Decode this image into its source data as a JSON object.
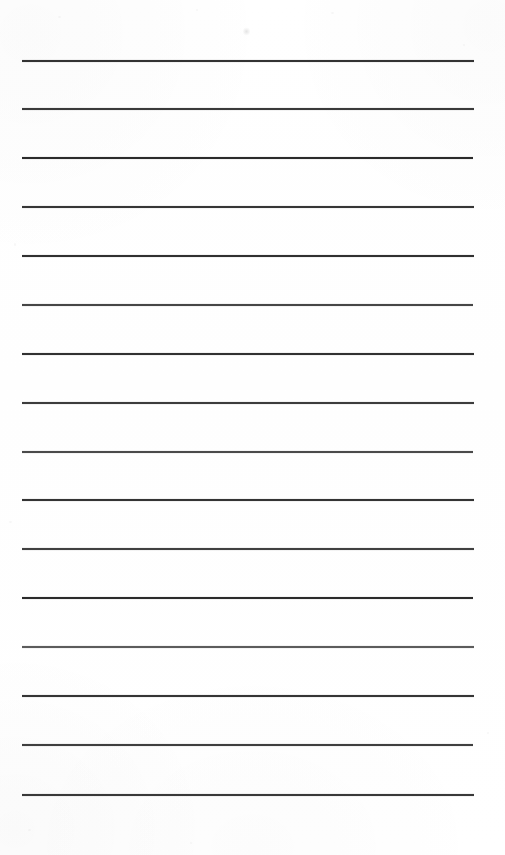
{
  "document": {
    "kind": "scanned-ruled-notepad-page",
    "page_width": 505,
    "page_height": 855,
    "background_color": "#ffffff",
    "text_content": "",
    "visible_text": []
  },
  "ruled_lines": {
    "count": 16,
    "left_x": 22,
    "right_x": 474,
    "first_line_y": 61,
    "spacing": 48.9,
    "default_color": "#2b2b2b",
    "items": [
      {
        "index": 1,
        "y": 61,
        "x1": 22,
        "x2": 474,
        "thickness": 1.6,
        "color": "#2e2e2e",
        "opacity": 0.96
      },
      {
        "index": 2,
        "y": 109,
        "x1": 22,
        "x2": 474,
        "thickness": 1.5,
        "color": "#313131",
        "opacity": 0.94
      },
      {
        "index": 3,
        "y": 158,
        "x1": 22,
        "x2": 473,
        "thickness": 1.7,
        "color": "#272727",
        "opacity": 0.97
      },
      {
        "index": 4,
        "y": 207,
        "x1": 22,
        "x2": 474,
        "thickness": 1.5,
        "color": "#2f2f2f",
        "opacity": 0.95
      },
      {
        "index": 5,
        "y": 256,
        "x1": 22,
        "x2": 474,
        "thickness": 1.6,
        "color": "#2b2b2b",
        "opacity": 0.96
      },
      {
        "index": 6,
        "y": 305,
        "x1": 22,
        "x2": 473,
        "thickness": 1.4,
        "color": "#3a3a3a",
        "opacity": 0.92
      },
      {
        "index": 7,
        "y": 354,
        "x1": 22,
        "x2": 474,
        "thickness": 1.6,
        "color": "#2c2c2c",
        "opacity": 0.96
      },
      {
        "index": 8,
        "y": 403,
        "x1": 22,
        "x2": 474,
        "thickness": 1.5,
        "color": "#333333",
        "opacity": 0.94
      },
      {
        "index": 9,
        "y": 452,
        "x1": 22,
        "x2": 473,
        "thickness": 1.4,
        "color": "#3d3d3d",
        "opacity": 0.91
      },
      {
        "index": 10,
        "y": 500,
        "x1": 22,
        "x2": 474,
        "thickness": 1.6,
        "color": "#2d2d2d",
        "opacity": 0.95
      },
      {
        "index": 11,
        "y": 549,
        "x1": 22,
        "x2": 474,
        "thickness": 1.5,
        "color": "#353535",
        "opacity": 0.93
      },
      {
        "index": 12,
        "y": 598,
        "x1": 22,
        "x2": 473,
        "thickness": 1.7,
        "color": "#282828",
        "opacity": 0.97
      },
      {
        "index": 13,
        "y": 647,
        "x1": 22,
        "x2": 474,
        "thickness": 1.4,
        "color": "#4a4a4a",
        "opacity": 0.88
      },
      {
        "index": 14,
        "y": 696,
        "x1": 22,
        "x2": 474,
        "thickness": 1.6,
        "color": "#2e2e2e",
        "opacity": 0.95
      },
      {
        "index": 15,
        "y": 745,
        "x1": 22,
        "x2": 473,
        "thickness": 1.5,
        "color": "#343434",
        "opacity": 0.93
      },
      {
        "index": 16,
        "y": 795,
        "x1": 22,
        "x2": 474,
        "thickness": 1.5,
        "color": "#303030",
        "opacity": 0.94
      }
    ]
  },
  "artifacts": {
    "speck": {
      "x": 243,
      "y": 27,
      "label": "scan-speck"
    },
    "dust": [
      {
        "x": 58,
        "y": 16,
        "w": 3,
        "h": 2
      },
      {
        "x": 196,
        "y": 9,
        "w": 2,
        "h": 2
      },
      {
        "x": 331,
        "y": 12,
        "w": 3,
        "h": 2
      },
      {
        "x": 463,
        "y": 44,
        "w": 2,
        "h": 2
      },
      {
        "x": 14,
        "y": 243,
        "w": 2,
        "h": 3
      },
      {
        "x": 9,
        "y": 521,
        "w": 3,
        "h": 2
      },
      {
        "x": 28,
        "y": 829,
        "w": 3,
        "h": 2
      },
      {
        "x": 190,
        "y": 842,
        "w": 2,
        "h": 2
      },
      {
        "x": 487,
        "y": 732,
        "w": 2,
        "h": 2
      }
    ]
  }
}
